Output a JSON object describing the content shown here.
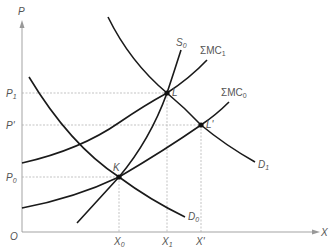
{
  "diagram": {
    "type": "supply-demand-marginal-cost",
    "axes": {
      "y_label": "P",
      "x_label": "X",
      "origin_label": "O"
    },
    "price_ticks": [
      {
        "main": "P",
        "sub": "1",
        "y": 93
      },
      {
        "main": "P'",
        "sub": "",
        "y": 125
      },
      {
        "main": "P",
        "sub": "0",
        "y": 177
      }
    ],
    "quantity_ticks": [
      {
        "main": "X",
        "sub": "0",
        "x": 119
      },
      {
        "main": "X",
        "sub": "1",
        "x": 167
      },
      {
        "main": "X'",
        "sub": "",
        "x": 201
      }
    ],
    "curves": [
      {
        "id": "S0",
        "main": "S",
        "sub": "0"
      },
      {
        "id": "SMC1",
        "main": "ΣMC",
        "sub": "1"
      },
      {
        "id": "SMC0",
        "main": "ΣMC",
        "sub": "0"
      },
      {
        "id": "D1",
        "main": "D",
        "sub": "1"
      },
      {
        "id": "D0",
        "main": "D",
        "sub": "0"
      }
    ],
    "points": [
      {
        "id": "K",
        "label": "K",
        "x": 119,
        "y": 177
      },
      {
        "id": "L",
        "label": "L",
        "x": 167,
        "y": 93
      },
      {
        "id": "Lp",
        "label": "L'",
        "x": 201,
        "y": 125
      }
    ]
  }
}
